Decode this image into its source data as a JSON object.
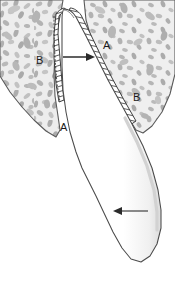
{
  "figure": {
    "canvas": {
      "width": 175,
      "height": 291,
      "background": "#ffffff"
    },
    "labels": [
      {
        "id": "A-top",
        "text": "A",
        "x": 103,
        "y": 40,
        "refers_to": "root-surface-upper-right"
      },
      {
        "id": "B-left",
        "text": "B",
        "x": 36,
        "y": 55,
        "refers_to": "alveolar-bone-left"
      },
      {
        "id": "B-right",
        "text": "B",
        "x": 133,
        "y": 92,
        "refers_to": "alveolar-bone-right"
      },
      {
        "id": "A-bottom",
        "text": "A",
        "x": 60,
        "y": 122,
        "refers_to": "root-surface-lower-left"
      }
    ],
    "arrows": [
      {
        "id": "arrow-upper",
        "direction": "right",
        "x1": 63,
        "y1": 57,
        "x2": 93,
        "y2": 57
      },
      {
        "id": "arrow-lower",
        "direction": "left",
        "x1": 148,
        "y1": 211,
        "x2": 115,
        "y2": 211
      }
    ],
    "colors": {
      "bone_fill": "#e9e9e9",
      "bone_trabecula": "#b4b4b4",
      "outline": "#4a4a4a",
      "hatch_line": "#2b2b2b",
      "tooth_fill": "#ffffff",
      "label_text": "#1a1a1a",
      "arrow": "#2b2b2b",
      "background": "#ffffff"
    },
    "regions": [
      {
        "id": "alveolar-bone-left",
        "name": "Alveolar bone (left)"
      },
      {
        "id": "alveolar-bone-right",
        "name": "Alveolar bone (right)"
      },
      {
        "id": "tooth-root",
        "name": "Tooth root"
      },
      {
        "id": "hatched-band-left",
        "name": "Hatched band (left)"
      },
      {
        "id": "hatched-band-right",
        "name": "Hatched band (right)"
      }
    ]
  }
}
